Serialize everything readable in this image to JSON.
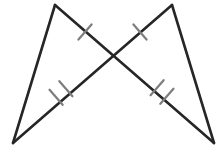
{
  "figure": {
    "canvas": {
      "width": 222,
      "height": 145,
      "background": "#ffffff"
    },
    "colors": {
      "stroke": "#262626",
      "tick": "#7d7d7d",
      "background": "#ffffff"
    },
    "stroke_widths": {
      "segment": 2.6,
      "tick": 2.2
    },
    "points": {
      "left_apex": {
        "label": "left-apex",
        "x": 55,
        "y": 5
      },
      "right_apex": {
        "label": "right-apex",
        "x": 172,
        "y": 5
      },
      "bottom_left": {
        "label": "bottom-left",
        "x": 13,
        "y": 143
      },
      "bottom_right": {
        "label": "bottom-right",
        "x": 214,
        "y": 143
      },
      "crossing": {
        "label": "crossing",
        "x": 114,
        "y": 55
      }
    },
    "segments": [
      {
        "name": "left-leg",
        "x1": 55,
        "y1": 5,
        "x2": 13,
        "y2": 143
      },
      {
        "name": "right-leg",
        "x1": 172,
        "y1": 5,
        "x2": 214,
        "y2": 143
      },
      {
        "name": "left-diagonal",
        "x1": 55,
        "y1": 5,
        "x2": 214,
        "y2": 143
      },
      {
        "name": "right-diagonal",
        "x1": 172,
        "y1": 5,
        "x2": 13,
        "y2": 143
      }
    ],
    "tick_marks": [
      {
        "name": "tick-upper-left",
        "count": 1,
        "cx": 85,
        "cy": 32,
        "angle": 41,
        "length": 20
      },
      {
        "name": "tick-upper-right",
        "count": 1,
        "cx": 140,
        "cy": 32,
        "angle": -41,
        "length": 20
      },
      {
        "name": "tick-lower-left-double",
        "count": 2,
        "cx": 61,
        "cy": 93,
        "angle": -41,
        "length": 20,
        "spacing": 13
      },
      {
        "name": "tick-lower-right-double",
        "count": 2,
        "cx": 162,
        "cy": 92,
        "angle": 41,
        "length": 20,
        "spacing": 13
      }
    ],
    "tick_legend": {
      "single": "one tick — congruent pair A",
      "double": "two ticks — congruent pair B"
    }
  }
}
